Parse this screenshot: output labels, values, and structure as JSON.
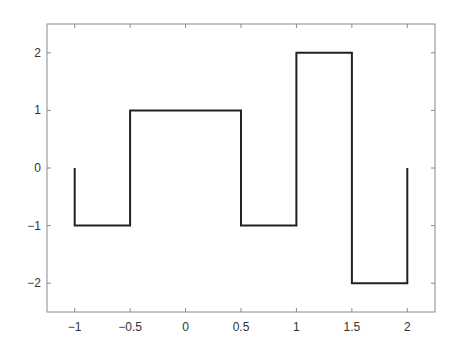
{
  "chart_data": {
    "type": "line",
    "title": "",
    "xlabel": "",
    "ylabel": "",
    "xlim": [
      -1.25,
      2.25
    ],
    "ylim": [
      -2.5,
      2.5
    ],
    "grid": false,
    "legend": null,
    "box": true,
    "x_ticks": [
      -1,
      -0.5,
      0,
      0.5,
      1,
      1.5,
      2
    ],
    "x_tick_labels": [
      "-1",
      "-0.5",
      "0",
      "0.5",
      "1",
      "1.5",
      "2"
    ],
    "y_ticks": [
      2,
      1,
      0,
      -1,
      -2
    ],
    "y_tick_labels": [
      "2",
      "1",
      "0",
      "-1",
      "-2"
    ],
    "series": [
      {
        "name": "piecewise-constant signal",
        "style": "step",
        "color": "#222222",
        "points": [
          [
            -1,
            0
          ],
          [
            -1,
            -1
          ],
          [
            -0.5,
            -1
          ],
          [
            -0.5,
            1
          ],
          [
            0.5,
            1
          ],
          [
            0.5,
            -1
          ],
          [
            1,
            -1
          ],
          [
            1,
            2
          ],
          [
            1.5,
            2
          ],
          [
            1.5,
            -2
          ],
          [
            2,
            -2
          ],
          [
            2,
            0
          ]
        ],
        "segments": [
          {
            "x_start": -1,
            "x_end": -0.5,
            "value": -1
          },
          {
            "x_start": -0.5,
            "x_end": 0.5,
            "value": 1
          },
          {
            "x_start": 0.5,
            "x_end": 1,
            "value": -1
          },
          {
            "x_start": 1,
            "x_end": 1.5,
            "value": 2
          },
          {
            "x_start": 1.5,
            "x_end": 2,
            "value": -2
          }
        ]
      }
    ]
  },
  "style": {
    "axis_color": "#8a8a8a",
    "line_color": "#222222",
    "text_color": "#333333"
  }
}
